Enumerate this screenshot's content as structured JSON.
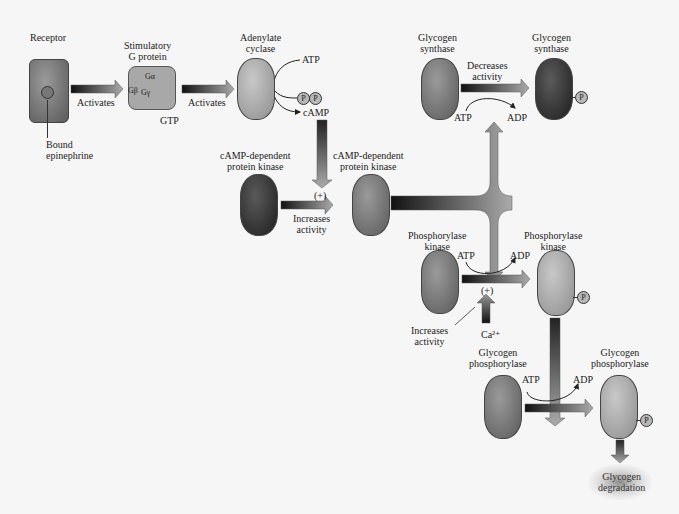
{
  "nodes": {
    "receptor": "Receptor",
    "bound_epinephrine": [
      "Bound",
      "epinephrine"
    ],
    "g_protein": [
      "Stimulatory",
      "G protein"
    ],
    "g_subunits": {
      "alpha": "Gα",
      "beta": "Gβ",
      "gamma": "Gγ"
    },
    "gtp": "GTP",
    "adenylate_cyclase": [
      "Adenylate",
      "cyclase"
    ],
    "atp1": "ATP",
    "ppi": [
      "P",
      "P"
    ],
    "camp": "cAMP",
    "pka_inactive": [
      "cAMP-dependent",
      "protein kinase"
    ],
    "pka_active": [
      "cAMP-dependent",
      "protein kinase"
    ],
    "gs_inactive": [
      "Glycogen",
      "synthase"
    ],
    "gs_phospho": [
      "Glycogen",
      "synthase"
    ],
    "phk_inactive": [
      "Phosphorylase",
      "kinase"
    ],
    "phk_active": [
      "Phosphorylase",
      "kinase"
    ],
    "gp_inactive": [
      "Glycogen",
      "phosphorylase"
    ],
    "gp_active": [
      "Glycogen",
      "phosphorylase"
    ],
    "degradation": [
      "Glycogen",
      "degradation"
    ],
    "phosphate": "P"
  },
  "edges": {
    "activates1": "Activates",
    "activates2": "Activates",
    "plus1": "(+)",
    "increases1": [
      "Increases",
      "activity"
    ],
    "decreases": [
      "Decreases",
      "activity"
    ],
    "atp_gs": "ATP",
    "adp_gs": "ADP",
    "atp_phk": "ATP",
    "adp_phk": "ADP",
    "plus2": "(+)",
    "increases2": [
      "Increases",
      "activity"
    ],
    "ca": "Ca²⁺",
    "atp_gp": "ATP",
    "adp_gp": "ADP"
  }
}
